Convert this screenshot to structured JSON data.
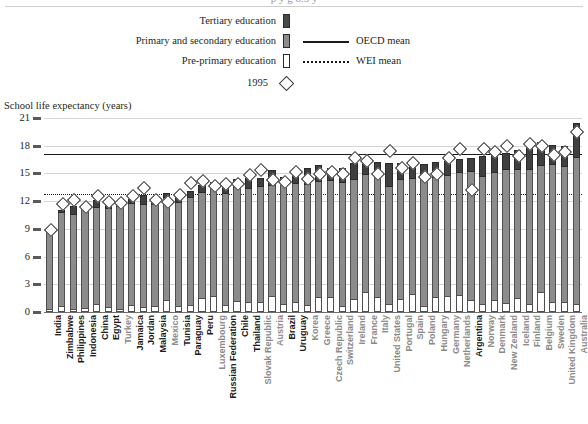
{
  "title_clip": "p y g 8.5 y",
  "axis_title": "School life expectancy (years)",
  "legend": {
    "tertiary": "Tertiary education",
    "primary_secondary": "Primary and secondary education",
    "preprimary": "Pre-primary education",
    "oecd_mean": "OECD mean",
    "wei_mean": "WEI mean",
    "year_marker": "1995"
  },
  "colors": {
    "tertiary": "#3f3f3f",
    "primary_secondary": "#8c8c8c",
    "preprimary": "#ffffff",
    "mean_line": "#1a1a1a",
    "wei_label": "#1b1b1b",
    "oecd_label": "#8a8a8a",
    "grid": "#d4d4d4"
  },
  "chart_data": {
    "type": "bar",
    "title": "School life expectancy (years)",
    "xlabel": "",
    "ylabel": "School life expectancy (years)",
    "ylim": [
      0,
      21
    ],
    "yticks": [
      0,
      3,
      6,
      9,
      12,
      15,
      18,
      21
    ],
    "grid": true,
    "legend_position": "top-center",
    "stacked": true,
    "series": [
      {
        "name": "Pre-primary education",
        "key": "pre"
      },
      {
        "name": "Primary and secondary education",
        "key": "prim"
      },
      {
        "name": "Tertiary education",
        "key": "tert"
      }
    ],
    "annotations": [
      {
        "name": "OECD mean",
        "type": "hline",
        "value": 17.1,
        "style": "solid"
      },
      {
        "name": "WEI mean",
        "type": "hline",
        "value": 12.8,
        "style": "dotted"
      },
      {
        "name": "1995",
        "type": "marker",
        "style": "open-diamond"
      }
    ],
    "categories": [
      "India",
      "Zimbabwe",
      "Philippines",
      "Indonesia",
      "China",
      "Egypt",
      "Turkey",
      "Jamaica",
      "Jordan",
      "Malaysia",
      "Mexico",
      "Tunisia",
      "Paraguay",
      "Peru",
      "Luxembourg",
      "Russian Federation",
      "Chile",
      "Thailand",
      "Slovak Republic",
      "Austria",
      "Brazil",
      "Uruguay",
      "Korea",
      "Greece",
      "Czech Republic",
      "Switzerland",
      "Ireland",
      "France",
      "Italy",
      "United States",
      "Portugal",
      "Spain",
      "Poland",
      "Hungary",
      "Germany",
      "Netherlands",
      "Argentina",
      "Norway",
      "Denmark",
      "New Zealand",
      "Iceland",
      "Finland",
      "Belgium",
      "Sweden",
      "United Kingdom",
      "Australia"
    ],
    "groups": [
      "WEI",
      "WEI",
      "WEI",
      "WEI",
      "WEI",
      "WEI",
      "OECD",
      "WEI",
      "WEI",
      "WEI",
      "OECD",
      "WEI",
      "WEI",
      "WEI",
      "OECD",
      "WEI",
      "WEI",
      "WEI",
      "OECD",
      "OECD",
      "WEI",
      "WEI",
      "OECD",
      "OECD",
      "OECD",
      "OECD",
      "OECD",
      "OECD",
      "OECD",
      "OECD",
      "OECD",
      "OECD",
      "OECD",
      "OECD",
      "OECD",
      "OECD",
      "WEI",
      "OECD",
      "OECD",
      "OECD",
      "OECD",
      "OECD",
      "OECD",
      "OECD",
      "OECD",
      "OECD"
    ],
    "pre": [
      0.3,
      0.7,
      0.3,
      0.4,
      0.9,
      0.5,
      0.3,
      0.8,
      0.5,
      0.7,
      1.3,
      0.6,
      0.8,
      1.5,
      1.7,
      0.8,
      1.2,
      1.1,
      1.1,
      1.7,
      0.9,
      1.1,
      0.8,
      1.6,
      1.6,
      0.7,
      1.4,
      2.2,
      1.6,
      0.9,
      1.4,
      2.0,
      0.6,
      1.6,
      1.7,
      1.8,
      1.3,
      0.9,
      1.3,
      1.0,
      1.5,
      0.9,
      2.2,
      1.1,
      1.1,
      0.9
    ],
    "prim": [
      8.5,
      10.0,
      10.2,
      10.6,
      10.4,
      10.6,
      11.1,
      10.9,
      11.1,
      10.9,
      11.0,
      11.2,
      11.5,
      11.4,
      11.8,
      12.0,
      12.2,
      12.2,
      12.4,
      11.9,
      13.1,
      12.8,
      12.9,
      12.5,
      12.6,
      13.3,
      12.9,
      12.6,
      13.3,
      12.6,
      12.9,
      12.4,
      13.8,
      12.9,
      13.0,
      13.2,
      13.9,
      13.7,
      13.7,
      14.4,
      13.9,
      14.5,
      13.6,
      14.8,
      14.6,
      15.8
    ],
    "tert": [
      0.2,
      0.3,
      1.0,
      0.3,
      0.8,
      1.1,
      0.5,
      0.5,
      1.1,
      0.7,
      0.6,
      0.9,
      0.8,
      0.9,
      0.6,
      1.0,
      1.0,
      1.2,
      1.0,
      1.8,
      0.6,
      1.1,
      1.9,
      1.8,
      1.4,
      1.6,
      1.8,
      1.8,
      1.3,
      2.6,
      1.8,
      2.0,
      1.6,
      1.7,
      1.7,
      1.6,
      1.5,
      2.3,
      2.1,
      1.8,
      2.1,
      2.6,
      2.6,
      2.2,
      2.3,
      3.8
    ],
    "values_total": [
      9.0,
      11.0,
      11.5,
      11.3,
      12.1,
      12.2,
      11.9,
      12.2,
      12.7,
      12.3,
      12.9,
      12.7,
      13.1,
      13.8,
      14.1,
      13.8,
      14.4,
      14.5,
      14.5,
      15.4,
      14.6,
      15.0,
      15.6,
      15.9,
      15.6,
      15.6,
      16.1,
      16.6,
      16.2,
      16.1,
      16.1,
      16.4,
      16.0,
      16.2,
      16.4,
      16.6,
      16.7,
      16.9,
      17.1,
      17.2,
      17.5,
      18.0,
      18.4,
      18.1,
      18.0,
      20.5
    ],
    "markers_1995": [
      9.0,
      11.8,
      12.2,
      11.5,
      12.7,
      12.0,
      11.9,
      12.7,
      13.5,
      12.2,
      12.0,
      12.8,
      14.1,
      14.3,
      13.8,
      14.0,
      14.0,
      14.9,
      15.5,
      14.4,
      14.2,
      15.3,
      14.5,
      15.0,
      15.3,
      15.0,
      16.8,
      16.4,
      15.0,
      17.5,
      15.7,
      16.2,
      14.7,
      15.0,
      16.8,
      17.8,
      13.3,
      17.7,
      17.4,
      18.1,
      17.0,
      18.3,
      18.1,
      17.1,
      17.4,
      19.6
    ]
  }
}
